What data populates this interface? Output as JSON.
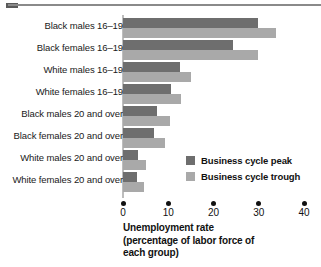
{
  "chart_data": {
    "type": "bar",
    "orientation": "horizontal",
    "title": "",
    "xlabel_lines": [
      "Unemployment rate",
      "(percentage of labor force of",
      "each group)"
    ],
    "ylabel": "",
    "xlim": [
      0,
      40
    ],
    "xticks": [
      0,
      10,
      20,
      30,
      40
    ],
    "xtick_labels": [
      "0",
      "10",
      "20",
      "30",
      "40"
    ],
    "grid": false,
    "legend_position": "inside-right",
    "categories": [
      "Black males 16–19",
      "Black females 16–19",
      "White males 16–19",
      "White females 16–19",
      "Black males 20 and over",
      "Black females 20 and over",
      "White males 20 and over",
      "White females 20 and over"
    ],
    "series": [
      {
        "name": "Business cycle peak",
        "color": "#6e6e6e",
        "values": [
          29.8,
          24.4,
          12.5,
          10.7,
          7.6,
          6.9,
          3.4,
          3.2
        ]
      },
      {
        "name": "Business cycle trough",
        "color": "#a9a9a9",
        "values": [
          33.8,
          29.8,
          15.1,
          12.9,
          10.4,
          9.3,
          5.1,
          4.7
        ]
      }
    ]
  },
  "legend": {
    "items": [
      {
        "label": "Business cycle peak",
        "color": "#6e6e6e"
      },
      {
        "label": "Business cycle trough",
        "color": "#a9a9a9"
      }
    ]
  }
}
